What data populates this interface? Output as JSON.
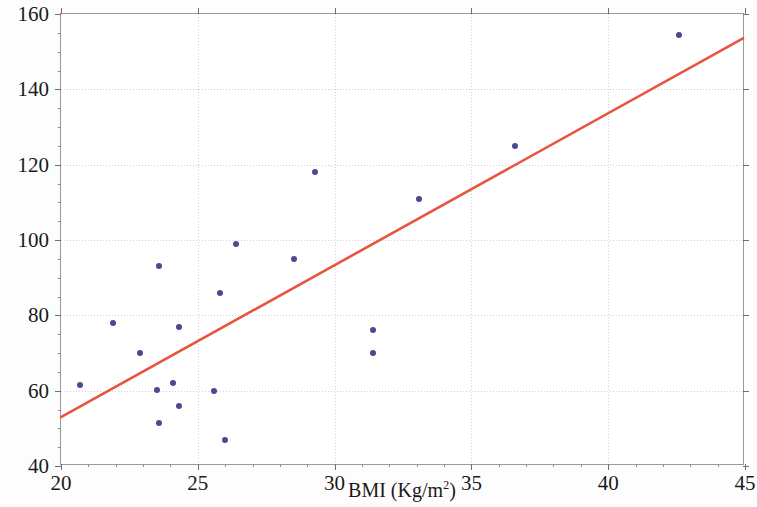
{
  "chart_data": {
    "type": "scatter",
    "title": "",
    "xlabel": "BMI (Kg/m²)",
    "xlabel_base": "BMI (Kg/m",
    "xlabel_sup": "2",
    "xlabel_tail": ")",
    "ylabel": "Time (Minutes)",
    "xlim": [
      20,
      45
    ],
    "ylim": [
      40,
      160
    ],
    "xticks": [
      20,
      25,
      30,
      35,
      40,
      45
    ],
    "yticks": [
      40,
      60,
      80,
      100,
      120,
      140,
      160
    ],
    "xtick_labels": [
      "20",
      "25",
      "30",
      "35",
      "40",
      "45"
    ],
    "ytick_labels": [
      "40",
      "60",
      "80",
      "100",
      "120",
      "140",
      "160"
    ],
    "x_minor_step": 1,
    "y_minor_step": 5,
    "grid": true,
    "grid_style": "dotted",
    "legend": "none",
    "marker_color": "#4a4a91",
    "line_color": "#e8553c",
    "grid_color": "#cfcfd8",
    "axis_color": "#9a9a9a",
    "series": [
      {
        "name": "Subjects",
        "type": "scatter",
        "marker": "filled-circle",
        "points": [
          {
            "x": 20.7,
            "y": 61.5
          },
          {
            "x": 21.9,
            "y": 78.0
          },
          {
            "x": 22.9,
            "y": 70.0
          },
          {
            "x": 23.6,
            "y": 93.0
          },
          {
            "x": 23.5,
            "y": 60.2
          },
          {
            "x": 23.6,
            "y": 51.3
          },
          {
            "x": 24.1,
            "y": 62.0
          },
          {
            "x": 24.3,
            "y": 77.0
          },
          {
            "x": 24.3,
            "y": 56.0
          },
          {
            "x": 25.6,
            "y": 60.0
          },
          {
            "x": 25.8,
            "y": 86.0
          },
          {
            "x": 26.0,
            "y": 47.0
          },
          {
            "x": 26.4,
            "y": 99.0
          },
          {
            "x": 28.5,
            "y": 95.0
          },
          {
            "x": 29.3,
            "y": 118.0
          },
          {
            "x": 31.4,
            "y": 76.0
          },
          {
            "x": 31.4,
            "y": 70.0
          },
          {
            "x": 33.1,
            "y": 111.0
          },
          {
            "x": 36.6,
            "y": 125.0
          },
          {
            "x": 42.6,
            "y": 154.5
          }
        ]
      },
      {
        "name": "Linear fit",
        "type": "line",
        "endpoints": [
          {
            "x": 20.0,
            "y": 52.5
          },
          {
            "x": 45.0,
            "y": 153.5
          }
        ]
      }
    ]
  }
}
